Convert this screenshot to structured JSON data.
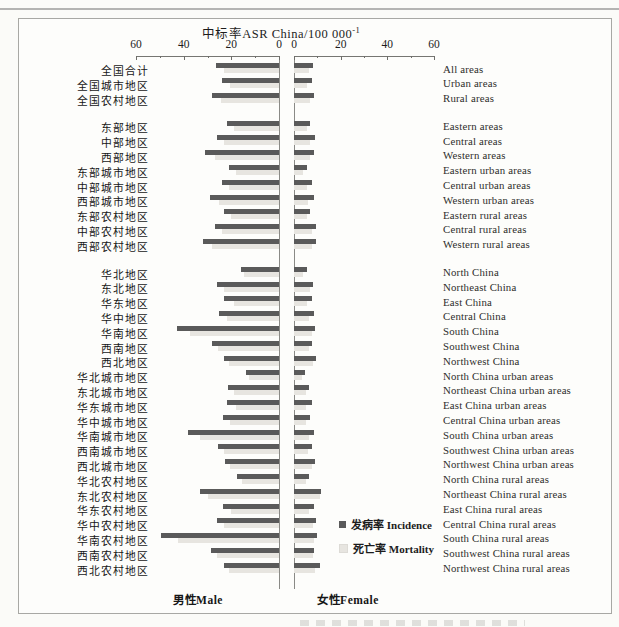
{
  "page": {
    "title_main": "中标率ASR China/100 000",
    "title_sup": "-1",
    "male_label": "男性Male",
    "female_label": "女性Female",
    "legend": {
      "incidence_label": "发病率 Incidence",
      "mortality_label": "死亡率 Mortality"
    },
    "colors": {
      "incidence": "#5a5a5a",
      "mortality": "#e7e5e0",
      "axis": "#767672"
    }
  },
  "chart_data": {
    "type": "bar",
    "orientation": "horizontal-bidirectional",
    "left_panel_label": "男性Male",
    "right_panel_label": "女性Female",
    "axis_range": [
      0,
      60
    ],
    "tick_labels_left": [
      "60",
      "40",
      "20",
      "0"
    ],
    "tick_labels_right": [
      "0",
      "20",
      "40",
      "60"
    ],
    "legend_position": "right-center-bottom",
    "series": [
      {
        "name": "发病率 Incidence",
        "color": "#5a5a5a"
      },
      {
        "name": "死亡率 Mortality",
        "color": "#e7e5e0"
      }
    ],
    "rows": [
      {
        "zh": "全国合计",
        "en": "All areas",
        "gap_before": false,
        "male_incidence": 26.5,
        "male_mortality": 23,
        "female_incidence": 8,
        "female_mortality": 6.5
      },
      {
        "zh": "全国城市地区",
        "en": "Urban areas",
        "gap_before": false,
        "male_incidence": 24,
        "male_mortality": 20.5,
        "female_incidence": 7.5,
        "female_mortality": 5.5
      },
      {
        "zh": "全国农村地区",
        "en": "Rural areas",
        "gap_before": false,
        "male_incidence": 28,
        "male_mortality": 24.5,
        "female_incidence": 8.5,
        "female_mortality": 7
      },
      {
        "zh": "东部地区",
        "en": "Eastern areas",
        "gap_before": true,
        "male_incidence": 22,
        "male_mortality": 19,
        "female_incidence": 7,
        "female_mortality": 5.5
      },
      {
        "zh": "中部地区",
        "en": "Central areas",
        "gap_before": false,
        "male_incidence": 26,
        "male_mortality": 23,
        "female_incidence": 9,
        "female_mortality": 7
      },
      {
        "zh": "西部地区",
        "en": "Western areas",
        "gap_before": false,
        "male_incidence": 31,
        "male_mortality": 27,
        "female_incidence": 8.5,
        "female_mortality": 7
      },
      {
        "zh": "东部城市地区",
        "en": "Eastern urban areas",
        "gap_before": false,
        "male_incidence": 21,
        "male_mortality": 18,
        "female_incidence": 5.5,
        "female_mortality": 4
      },
      {
        "zh": "中部城市地区",
        "en": "Central urban areas",
        "gap_before": false,
        "male_incidence": 24,
        "male_mortality": 21,
        "female_incidence": 7.5,
        "female_mortality": 5.5
      },
      {
        "zh": "西部城市地区",
        "en": "Western urban areas",
        "gap_before": false,
        "male_incidence": 29,
        "male_mortality": 25,
        "female_incidence": 8.5,
        "female_mortality": 6
      },
      {
        "zh": "东部农村地区",
        "en": "Eastern rural areas",
        "gap_before": false,
        "male_incidence": 23,
        "male_mortality": 20,
        "female_incidence": 7,
        "female_mortality": 5.5
      },
      {
        "zh": "中部农村地区",
        "en": "Central rural areas",
        "gap_before": false,
        "male_incidence": 27,
        "male_mortality": 24,
        "female_incidence": 9.5,
        "female_mortality": 7.5
      },
      {
        "zh": "西部农村地区",
        "en": "Western rural areas",
        "gap_before": false,
        "male_incidence": 32,
        "male_mortality": 28,
        "female_incidence": 9.5,
        "female_mortality": 7.5
      },
      {
        "zh": "华北地区",
        "en": "North China",
        "gap_before": true,
        "male_incidence": 16,
        "male_mortality": 14.5,
        "female_incidence": 5.5,
        "female_mortality": 4
      },
      {
        "zh": "东北地区",
        "en": "Northeast China",
        "gap_before": false,
        "male_incidence": 26,
        "male_mortality": 23,
        "female_incidence": 8,
        "female_mortality": 7
      },
      {
        "zh": "华东地区",
        "en": "East China",
        "gap_before": false,
        "male_incidence": 23,
        "male_mortality": 19,
        "female_incidence": 7.5,
        "female_mortality": 5.5
      },
      {
        "zh": "华中地区",
        "en": "Central China",
        "gap_before": false,
        "male_incidence": 25,
        "male_mortality": 22,
        "female_incidence": 8.5,
        "female_mortality": 6.5
      },
      {
        "zh": "华南地区",
        "en": "South China",
        "gap_before": false,
        "male_incidence": 43,
        "male_mortality": 37.5,
        "female_incidence": 9,
        "female_mortality": 7.5
      },
      {
        "zh": "西南地区",
        "en": "Southwest China",
        "gap_before": false,
        "male_incidence": 28,
        "male_mortality": 25.5,
        "female_incidence": 7.5,
        "female_mortality": 6.5
      },
      {
        "zh": "西北地区",
        "en": "Northwest China",
        "gap_before": false,
        "male_incidence": 23,
        "male_mortality": 21,
        "female_incidence": 9.5,
        "female_mortality": 8
      },
      {
        "zh": "华北城市地区",
        "en": "North China urban areas",
        "gap_before": false,
        "male_incidence": 14,
        "male_mortality": 12.5,
        "female_incidence": 4.5,
        "female_mortality": 3.5
      },
      {
        "zh": "东北城市地区",
        "en": "Northeast China urban areas",
        "gap_before": false,
        "male_incidence": 21.5,
        "male_mortality": 19,
        "female_incidence": 6.5,
        "female_mortality": 5
      },
      {
        "zh": "华东城市地区",
        "en": "East China urban areas",
        "gap_before": false,
        "male_incidence": 22,
        "male_mortality": 18,
        "female_incidence": 7.5,
        "female_mortality": 5
      },
      {
        "zh": "华中城市地区",
        "en": "Central China urban areas",
        "gap_before": false,
        "male_incidence": 23.5,
        "male_mortality": 20.5,
        "female_incidence": 7,
        "female_mortality": 5
      },
      {
        "zh": "华南城市地区",
        "en": "South China urban areas",
        "gap_before": false,
        "male_incidence": 38,
        "male_mortality": 33,
        "female_incidence": 8.5,
        "female_mortality": 6.5
      },
      {
        "zh": "西南城市地区",
        "en": "Southwest China urban areas",
        "gap_before": false,
        "male_incidence": 25.5,
        "male_mortality": 23,
        "female_incidence": 7.5,
        "female_mortality": 6
      },
      {
        "zh": "西北城市地区",
        "en": "Northwest China urban areas",
        "gap_before": false,
        "male_incidence": 22.5,
        "male_mortality": 20.5,
        "female_incidence": 9,
        "female_mortality": 7.5
      },
      {
        "zh": "华北农村地区",
        "en": "North China rural areas",
        "gap_before": false,
        "male_incidence": 17.5,
        "male_mortality": 15.5,
        "female_incidence": 6.5,
        "female_mortality": 5
      },
      {
        "zh": "东北农村地区",
        "en": "Northeast China rural areas",
        "gap_before": false,
        "male_incidence": 33,
        "male_mortality": 30,
        "female_incidence": 11.5,
        "female_mortality": 11
      },
      {
        "zh": "华东农村地区",
        "en": "East China rural areas",
        "gap_before": false,
        "male_incidence": 23.5,
        "male_mortality": 20,
        "female_incidence": 8.5,
        "female_mortality": 6.5
      },
      {
        "zh": "华中农村地区",
        "en": "Central China rural areas",
        "gap_before": false,
        "male_incidence": 26,
        "male_mortality": 23,
        "female_incidence": 9.5,
        "female_mortality": 8
      },
      {
        "zh": "华南农村地区",
        "en": "South China rural areas",
        "gap_before": false,
        "male_incidence": 49.5,
        "male_mortality": 42.5,
        "female_incidence": 10,
        "female_mortality": 8.5
      },
      {
        "zh": "西南农村地区",
        "en": "Southwest China rural areas",
        "gap_before": false,
        "male_incidence": 28.5,
        "male_mortality": 26,
        "female_incidence": 8.5,
        "female_mortality": 8
      },
      {
        "zh": "西北农村地区",
        "en": "Northwest China rural areas",
        "gap_before": false,
        "male_incidence": 23,
        "male_mortality": 21,
        "female_incidence": 11,
        "female_mortality": 9
      }
    ]
  }
}
